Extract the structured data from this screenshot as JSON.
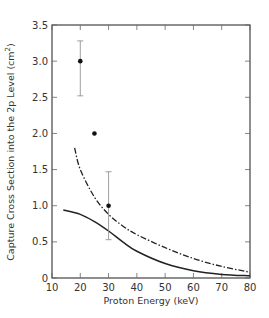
{
  "chart_data": {
    "type": "line",
    "title": "",
    "xlabel": "Proton Energy (keV)",
    "ylabel": "Capture Cross Section into the 2p Level  (cm²)",
    "ylabel_parts": {
      "main": "Capture Cross Section into the 2p Level  (cm",
      "sup": "2",
      "close": ")"
    },
    "xlim": [
      10,
      80
    ],
    "ylim": [
      0,
      3.5
    ],
    "x_ticks": [
      "10",
      "20",
      "30",
      "40",
      "50",
      "60",
      "70",
      "80"
    ],
    "y_ticks": [
      "0",
      "0.5",
      "1.0",
      "1.5",
      "2.0",
      "2.5",
      "3.0",
      "3.5"
    ],
    "grid": false,
    "legend": null,
    "series": [
      {
        "name": "solid curve",
        "style": "solid",
        "x": [
          14,
          20,
          25,
          30,
          35,
          40,
          50,
          60,
          70,
          80
        ],
        "y": [
          0.94,
          0.88,
          0.78,
          0.65,
          0.5,
          0.37,
          0.2,
          0.1,
          0.05,
          0.03
        ]
      },
      {
        "name": "dash-dot curve",
        "style": "dash-dot",
        "x": [
          18,
          20,
          25,
          30,
          35,
          40,
          50,
          60,
          70,
          80
        ],
        "y": [
          1.8,
          1.5,
          1.12,
          0.88,
          0.72,
          0.6,
          0.42,
          0.27,
          0.16,
          0.08
        ]
      },
      {
        "name": "experimental points",
        "style": "scatter",
        "points": [
          {
            "x": 20,
            "y": 3.0,
            "err_low": 2.52,
            "err_high": 3.28
          },
          {
            "x": 25,
            "y": 2.0
          },
          {
            "x": 30,
            "y": 1.0,
            "err_low": 0.53,
            "err_high": 1.47
          }
        ]
      }
    ]
  }
}
